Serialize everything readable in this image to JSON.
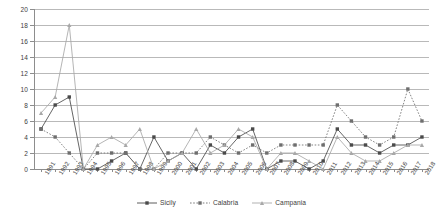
{
  "chart_data": {
    "type": "line",
    "title": "",
    "subtitle": "",
    "xlabel": "",
    "ylabel": "",
    "ylim": [
      0,
      20
    ],
    "ytick_step": 2,
    "yticks": [
      0,
      2,
      4,
      6,
      8,
      10,
      12,
      14,
      16,
      18,
      20
    ],
    "grid": true,
    "legend_position": "bottom-center",
    "categories": [
      "1991",
      "1992",
      "1993",
      "1994",
      "1995",
      "1996",
      "1997",
      "1998",
      "1999",
      "2000",
      "2001",
      "2002",
      "2003",
      "2004",
      "2005",
      "2006",
      "2007",
      "2008",
      "2009",
      "2010",
      "2011",
      "2012",
      "2013",
      "2014",
      "2015",
      "2016",
      "2017",
      "2018"
    ],
    "series": [
      {
        "name": "Sicily",
        "color": "#4a4a4a",
        "marker": "square",
        "style": "solid",
        "values": [
          5,
          8,
          9,
          0,
          0,
          1,
          2,
          0,
          4,
          1,
          2,
          0,
          3,
          2,
          4,
          5,
          0,
          1,
          1,
          0,
          1,
          5,
          3,
          3,
          2,
          3,
          3,
          4
        ]
      },
      {
        "name": "Calabria",
        "color": "#6e6e6e",
        "marker": "square",
        "style": "dotted",
        "values": [
          5,
          4,
          2,
          0,
          2,
          2,
          2,
          0,
          0,
          2,
          2,
          2,
          4,
          3,
          2,
          3,
          2,
          3,
          3,
          3,
          3,
          8,
          6,
          4,
          3,
          4,
          10,
          6
        ]
      },
      {
        "name": "Campania",
        "color": "#a8a8a8",
        "marker": "triangle",
        "style": "solid",
        "values": [
          7,
          9,
          18,
          0,
          3,
          4,
          3,
          5,
          0,
          1,
          2,
          5,
          2,
          3,
          5,
          4,
          0,
          2,
          2,
          1,
          0,
          4,
          2,
          1,
          1,
          2,
          3,
          3
        ]
      }
    ]
  },
  "legend": {
    "entries": [
      {
        "label": "Sicily"
      },
      {
        "label": "Calabria"
      },
      {
        "label": "Campania"
      }
    ]
  }
}
